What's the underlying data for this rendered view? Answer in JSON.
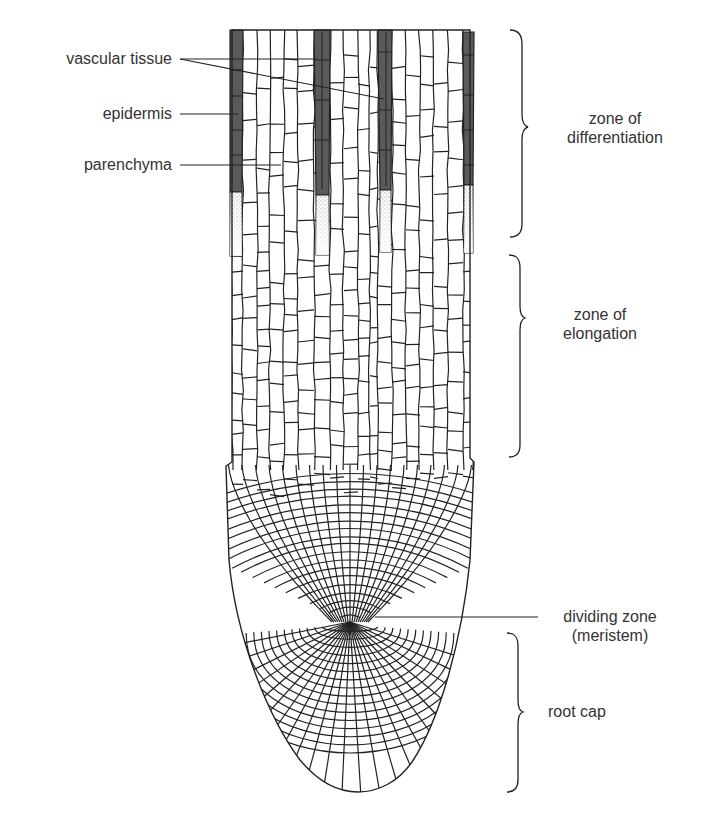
{
  "diagram": {
    "left_labels": {
      "vascular_tissue": "vascular tissue",
      "epidermis": "epidermis",
      "parenchyma": "parenchyma"
    },
    "zones": {
      "differentiation": {
        "line1": "zone of",
        "line2": "differentiation"
      },
      "elongation": {
        "line1": "zone of",
        "line2": "elongation"
      },
      "dividing": {
        "line1": "dividing zone",
        "line2": "(meristem)"
      },
      "root_cap": {
        "line1": "root cap"
      }
    },
    "colors": {
      "ink": "#222222",
      "label_text": "#333333",
      "vascular_fill": "#5a5a5a",
      "stipple": "#8a8a8a",
      "background": "#ffffff"
    }
  }
}
